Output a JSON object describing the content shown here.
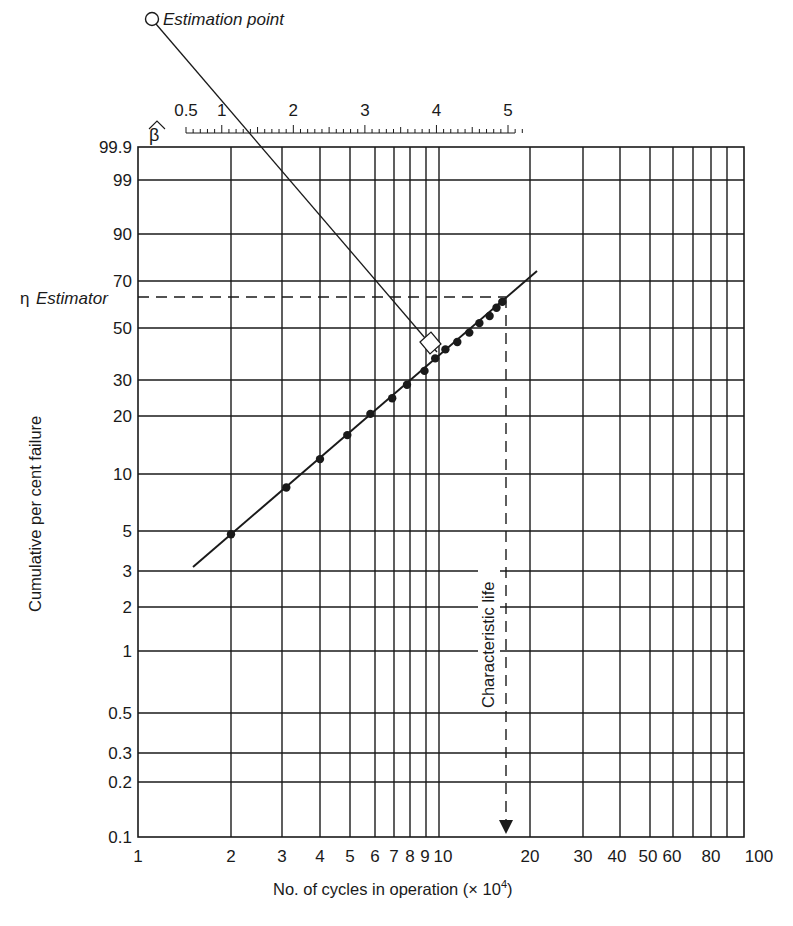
{
  "chart_data": {
    "type": "scatter",
    "title": "",
    "subtitle": "Weibull probability plot",
    "xlabel": "No. of cycles in operation (× 10",
    "xlabel_exp": "4",
    "xlabel_close": ")",
    "ylabel": "Cumulative per cent failure",
    "xscale": "log",
    "yscale": "weibull",
    "xlim": [
      1,
      100
    ],
    "ylim": [
      0.1,
      99.9
    ],
    "grid": true,
    "x_ticks": [
      "1",
      "2",
      "3",
      "4",
      "5",
      "6",
      "7",
      "8",
      "9",
      "10",
      "20",
      "30",
      "40",
      "50",
      "60",
      "80",
      "100"
    ],
    "x_tick_labels_display": [
      "1",
      "2",
      "3",
      "4",
      "5",
      "678910",
      "20",
      "30",
      "40 5060",
      "80",
      "100"
    ],
    "y_ticks": [
      "99.9",
      "99",
      "90",
      "70",
      "50",
      "30",
      "20",
      "10",
      "5",
      "3",
      "2",
      "1",
      "0.5",
      "0.3",
      "0.2",
      "0.1"
    ],
    "series": [
      {
        "name": "Failure data",
        "marker": "filled-circle",
        "x": [
          2.0,
          3.1,
          4.0,
          4.9,
          5.8,
          6.9,
          7.8,
          8.9,
          9.7,
          10.5,
          11.5,
          12.6,
          13.6,
          14.7,
          15.5,
          16.2
        ],
        "y": [
          4.8,
          8.5,
          12,
          16,
          20.5,
          24.5,
          28.5,
          33,
          37.5,
          41,
          44,
          48,
          52,
          55,
          58.5,
          61
        ]
      },
      {
        "name": "Fitted Weibull line",
        "type": "line",
        "x": [
          1.6,
          21
        ],
        "y": [
          3.1,
          72
        ]
      }
    ],
    "beta_scale": {
      "symbol": "β̂",
      "labels": [
        "0.5",
        "1",
        "2",
        "3",
        "4",
        "5"
      ],
      "range": [
        0.5,
        5.2
      ]
    },
    "annotations": {
      "estimation_point": "Estimation point",
      "eta_symbol": "η",
      "eta_label": "Estimator",
      "eta_percent": 63.2,
      "characteristic_life": "Characteristic life",
      "characteristic_life_x": 17
    }
  }
}
